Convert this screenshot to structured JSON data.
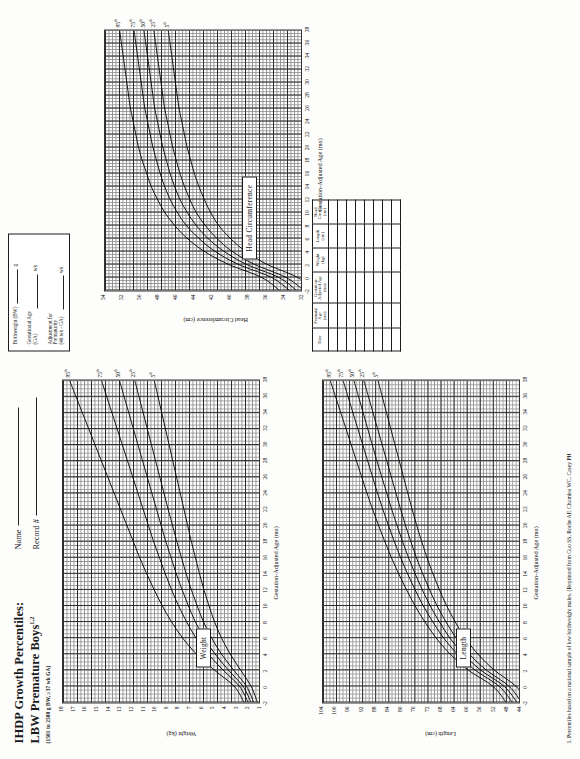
{
  "header": {
    "title_line1": "IHDP Growth Percentiles:",
    "title_line2": "LBW Premature Boys",
    "title_line2_sup": "1,2",
    "subtitle": "(1501 to 2500 g BW, ≥37 wk GA)",
    "name_label": "Name",
    "record_label": "Record #"
  },
  "legend": {
    "rows": [
      {
        "label": "Birthweight (BW)",
        "unit": "g"
      },
      {
        "label": "Gestational Age\n(GA)",
        "unit": "wk"
      },
      {
        "label": "Adjustment for\nPrematurity\n(40 wk - GA)",
        "unit": "wk"
      }
    ]
  },
  "data_table": {
    "columns": [
      "Date",
      "Postnatal\nAge\n(mo)",
      "Gestation-\nAdjusted Age\n(mo)",
      "Weight\n(kg)",
      "Length\n(cm)",
      "Head\nCircum.\n(cm)"
    ],
    "row_count": 8
  },
  "footnote": {
    "text": "1. Percentiles based on a national sample of low birthweight males. (Reprinted from Guo SS, Roche AF, Chumlea WC, Casey PH"
  },
  "chart_data": [
    {
      "id": "weight",
      "type": "line",
      "title": "Weight",
      "xlabel": "Gestation-Adjusted Age (mo)",
      "ylabel": "Weight (kg)",
      "xlim": [
        -2,
        38
      ],
      "ylim": [
        1,
        18
      ],
      "xticks": [
        -2,
        0,
        2,
        4,
        6,
        8,
        10,
        12,
        14,
        16,
        18,
        20,
        22,
        24,
        26,
        28,
        30,
        32,
        34,
        36,
        38
      ],
      "yticks": [
        1,
        2,
        3,
        4,
        5,
        6,
        7,
        8,
        9,
        10,
        11,
        12,
        13,
        14,
        15,
        16,
        17,
        18
      ],
      "x": [
        -2,
        0,
        2,
        4,
        6,
        8,
        10,
        12,
        14,
        16,
        18,
        20,
        22,
        24,
        26,
        28,
        30,
        32,
        34,
        36,
        38
      ],
      "series": [
        {
          "name": "95th",
          "label": "95",
          "sup": "th",
          "values": [
            2.45,
            3.3,
            5.0,
            6.55,
            7.75,
            8.7,
            9.5,
            10.2,
            10.85,
            11.45,
            12.0,
            12.55,
            13.1,
            13.65,
            14.2,
            14.75,
            15.3,
            15.85,
            16.4,
            16.95,
            17.5
          ]
        },
        {
          "name": "75th",
          "label": "75",
          "sup": "th",
          "values": [
            2.1,
            2.85,
            4.25,
            5.55,
            6.6,
            7.4,
            8.1,
            8.7,
            9.25,
            9.75,
            10.25,
            10.7,
            11.15,
            11.6,
            12.05,
            12.5,
            12.95,
            13.4,
            13.85,
            14.3,
            14.75
          ]
        },
        {
          "name": "50th",
          "label": "50",
          "sup": "th",
          "values": [
            1.85,
            2.55,
            3.8,
            4.95,
            5.9,
            6.65,
            7.25,
            7.8,
            8.3,
            8.75,
            9.2,
            9.6,
            10.0,
            10.4,
            10.8,
            11.2,
            11.6,
            12.0,
            12.4,
            12.8,
            13.2
          ]
        },
        {
          "name": "25th",
          "label": "25",
          "sup": "th",
          "values": [
            1.62,
            2.25,
            3.35,
            4.4,
            5.25,
            5.95,
            6.5,
            7.0,
            7.45,
            7.85,
            8.25,
            8.62,
            9.0,
            9.36,
            9.72,
            10.08,
            10.44,
            10.8,
            11.16,
            11.52,
            11.88
          ]
        },
        {
          "name": "5th",
          "label": "5",
          "sup": "th",
          "values": [
            1.3,
            1.85,
            2.75,
            3.65,
            4.4,
            5.0,
            5.48,
            5.92,
            6.3,
            6.65,
            7.0,
            7.32,
            7.64,
            7.96,
            8.28,
            8.6,
            8.92,
            9.24,
            9.56,
            9.88,
            10.2
          ]
        }
      ]
    },
    {
      "id": "length",
      "type": "line",
      "title": "Length",
      "xlabel": "Gestation-Adjusted Age (mo)",
      "ylabel": "Length (cm)",
      "xlim": [
        -2,
        38
      ],
      "ylim": [
        44,
        104
      ],
      "xticks": [
        -2,
        0,
        2,
        4,
        6,
        8,
        10,
        12,
        14,
        16,
        18,
        20,
        22,
        24,
        26,
        28,
        30,
        32,
        34,
        36,
        38
      ],
      "yticks": [
        44,
        48,
        52,
        56,
        60,
        64,
        68,
        72,
        76,
        80,
        84,
        88,
        92,
        96,
        100,
        104
      ],
      "x": [
        -2,
        0,
        2,
        4,
        6,
        8,
        10,
        12,
        14,
        16,
        18,
        20,
        22,
        24,
        26,
        28,
        30,
        32,
        34,
        36,
        38
      ],
      "series": [
        {
          "name": "95th",
          "label": "95",
          "sup": "th",
          "values": [
            48.5,
            52.5,
            60.0,
            65.5,
            69.8,
            73.2,
            76.2,
            78.8,
            81.2,
            83.4,
            85.4,
            87.3,
            89.1,
            90.8,
            92.4,
            94.0,
            95.6,
            97.2,
            98.8,
            100.4,
            102.0
          ]
        },
        {
          "name": "75th",
          "label": "75",
          "sup": "th",
          "values": [
            46.6,
            50.6,
            57.9,
            63.3,
            67.5,
            70.8,
            73.7,
            76.2,
            78.5,
            80.6,
            82.5,
            84.3,
            86.0,
            87.6,
            89.1,
            90.6,
            92.1,
            93.6,
            95.1,
            96.6,
            98.1
          ]
        },
        {
          "name": "50th",
          "label": "50",
          "sup": "th",
          "values": [
            45.2,
            49.1,
            56.2,
            61.5,
            65.6,
            68.8,
            71.6,
            74.0,
            76.2,
            78.2,
            80.0,
            81.7,
            83.3,
            84.8,
            86.3,
            87.8,
            89.2,
            90.6,
            92.0,
            93.4,
            94.8
          ]
        },
        {
          "name": "25th",
          "label": "25",
          "sup": "th",
          "values": [
            43.8,
            47.6,
            54.5,
            59.7,
            63.7,
            66.8,
            69.5,
            71.8,
            73.9,
            75.8,
            77.5,
            79.1,
            80.6,
            82.0,
            83.4,
            84.8,
            86.2,
            87.6,
            89.0,
            90.4,
            91.8
          ]
        },
        {
          "name": "5th",
          "label": "5",
          "sup": "th",
          "values": [
            41.8,
            45.5,
            52.1,
            57.1,
            61.0,
            64.0,
            66.6,
            68.8,
            70.8,
            72.6,
            74.2,
            75.7,
            77.1,
            78.4,
            79.7,
            81.0,
            82.3,
            83.6,
            84.9,
            86.2,
            87.5
          ]
        }
      ]
    },
    {
      "id": "head",
      "type": "line",
      "title": "Head Circumference",
      "xlabel": "Gestation-Adjusted Age (mo)",
      "ylabel": "Head Circumference (cm)",
      "xlim": [
        -2,
        38
      ],
      "ylim": [
        32,
        54
      ],
      "xticks": [
        -2,
        0,
        2,
        4,
        6,
        8,
        10,
        12,
        14,
        16,
        18,
        20,
        22,
        24,
        26,
        28,
        30,
        32,
        34,
        36,
        38
      ],
      "yticks": [
        32,
        34,
        36,
        38,
        40,
        42,
        44,
        46,
        48,
        50,
        52,
        54
      ],
      "x": [
        -2,
        0,
        2,
        4,
        6,
        8,
        10,
        12,
        14,
        16,
        18,
        20,
        22,
        24,
        26,
        28,
        30,
        32,
        34,
        36,
        38
      ],
      "series": [
        {
          "name": "95th",
          "label": "95",
          "sup": "th",
          "values": [
            34.6,
            36.6,
            40.3,
            43.0,
            44.9,
            46.3,
            47.4,
            48.2,
            48.9,
            49.4,
            49.9,
            50.3,
            50.6,
            50.9,
            51.2,
            51.4,
            51.6,
            51.8,
            52.0,
            52.2,
            52.4
          ]
        },
        {
          "name": "75th",
          "label": "75",
          "sup": "th",
          "values": [
            33.5,
            35.5,
            39.2,
            41.8,
            43.6,
            45.0,
            46.0,
            46.8,
            47.4,
            47.9,
            48.3,
            48.7,
            49.0,
            49.3,
            49.6,
            49.8,
            50.0,
            50.2,
            50.4,
            50.6,
            50.8
          ]
        },
        {
          "name": "50th",
          "label": "50",
          "sup": "th",
          "values": [
            32.7,
            34.7,
            38.3,
            40.8,
            42.6,
            43.9,
            44.9,
            45.7,
            46.3,
            46.8,
            47.2,
            47.6,
            47.9,
            48.2,
            48.5,
            48.7,
            48.9,
            49.1,
            49.3,
            49.5,
            49.7
          ]
        },
        {
          "name": "25th",
          "label": "25",
          "sup": "th",
          "values": [
            31.9,
            33.9,
            37.4,
            39.9,
            41.6,
            42.9,
            43.9,
            44.6,
            45.2,
            45.7,
            46.1,
            46.5,
            46.8,
            47.1,
            47.4,
            47.6,
            47.8,
            48.0,
            48.2,
            48.4,
            48.6
          ]
        },
        {
          "name": "5th",
          "label": "5",
          "sup": "th",
          "values": [
            30.7,
            32.6,
            36.0,
            38.4,
            40.1,
            41.4,
            42.3,
            43.0,
            43.6,
            44.1,
            44.5,
            44.9,
            45.2,
            45.5,
            45.8,
            46.0,
            46.2,
            46.4,
            46.6,
            46.8,
            47.0
          ]
        }
      ]
    }
  ]
}
